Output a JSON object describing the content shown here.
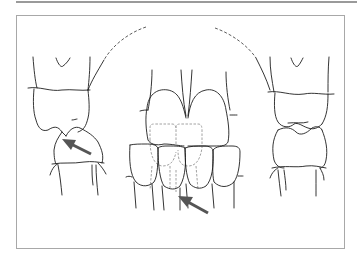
{
  "figure": {
    "type": "dental occlusion line drawing",
    "views": [
      "right-lateral",
      "frontal",
      "left-lateral"
    ],
    "annotations": [
      {
        "kind": "arrow",
        "view": "right-lateral",
        "direction": "up-left"
      },
      {
        "kind": "arrow",
        "view": "frontal",
        "direction": "up-left"
      }
    ],
    "colors": {
      "line": "#1e1e1e",
      "arrow": "#555555",
      "dashed_outline": "#8a8a8a",
      "frame": "#a8a8a8",
      "background": "#ffffff"
    }
  }
}
